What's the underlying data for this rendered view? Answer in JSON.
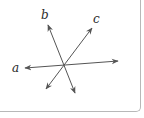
{
  "diagram": {
    "intersection": {
      "x": 63,
      "y": 66
    },
    "line_color": "#555555",
    "lines": [
      {
        "id": "a",
        "label": "a",
        "label_pos": {
          "x": 12,
          "y": 72
        },
        "start": {
          "x": 25,
          "y": 68
        },
        "end": {
          "x": 118,
          "y": 61
        }
      },
      {
        "id": "b",
        "label": "b",
        "label_pos": {
          "x": 41,
          "y": 19
        },
        "start": {
          "x": 48,
          "y": 25
        },
        "end": {
          "x": 75,
          "y": 93
        }
      },
      {
        "id": "c",
        "label": "c",
        "label_pos": {
          "x": 93,
          "y": 23
        },
        "start": {
          "x": 92,
          "y": 28
        },
        "end": {
          "x": 46,
          "y": 89
        }
      }
    ]
  }
}
